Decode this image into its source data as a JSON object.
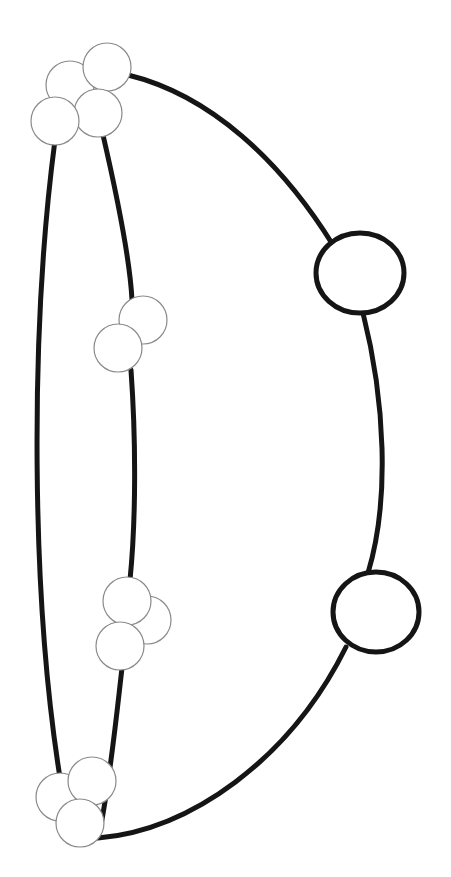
{
  "diagram": {
    "width": 451,
    "height": 877,
    "background": "#ffffff",
    "edge_color": "#151515",
    "thin_node_stroke": "#8a8a8a",
    "edges": [
      {
        "name": "left-outer-curve",
        "d": "M 55 140 C 30 330, 30 600, 62 790"
      },
      {
        "name": "inner-curve-top",
        "d": "M 103 135 C 118 200, 130 260, 132 300"
      },
      {
        "name": "inner-curve-middle",
        "d": "M 131 370 C 136 440, 136 520, 130 580"
      },
      {
        "name": "inner-curve-bottom",
        "d": "M 122 668 C 116 720, 110 780, 100 830"
      },
      {
        "name": "right-arc-top",
        "d": "M 128 75 C 210 95, 280 160, 333 245"
      },
      {
        "name": "right-arc-middle",
        "d": "M 363 313 C 385 400, 390 500, 368 573"
      },
      {
        "name": "right-arc-bottom",
        "d": "M 346 647 C 290 760, 190 830, 98 838"
      }
    ],
    "thin_nodes": [
      {
        "cx": 70,
        "cy": 85,
        "r": 24
      },
      {
        "cx": 107,
        "cy": 67,
        "r": 24
      },
      {
        "cx": 98,
        "cy": 113,
        "r": 24
      },
      {
        "cx": 55,
        "cy": 121,
        "r": 24
      },
      {
        "cx": 143,
        "cy": 320,
        "r": 24
      },
      {
        "cx": 118,
        "cy": 348,
        "r": 24
      },
      {
        "cx": 147,
        "cy": 620,
        "r": 24
      },
      {
        "cx": 127,
        "cy": 601,
        "r": 24
      },
      {
        "cx": 120,
        "cy": 646,
        "r": 24
      },
      {
        "cx": 60,
        "cy": 797,
        "r": 24
      },
      {
        "cx": 92,
        "cy": 781,
        "r": 24
      },
      {
        "cx": 80,
        "cy": 823,
        "r": 24
      }
    ],
    "thick_nodes": [
      {
        "cx": 360,
        "cy": 273,
        "rx": 44,
        "ry": 40
      },
      {
        "cx": 376,
        "cy": 612,
        "rx": 43,
        "ry": 40
      }
    ]
  }
}
